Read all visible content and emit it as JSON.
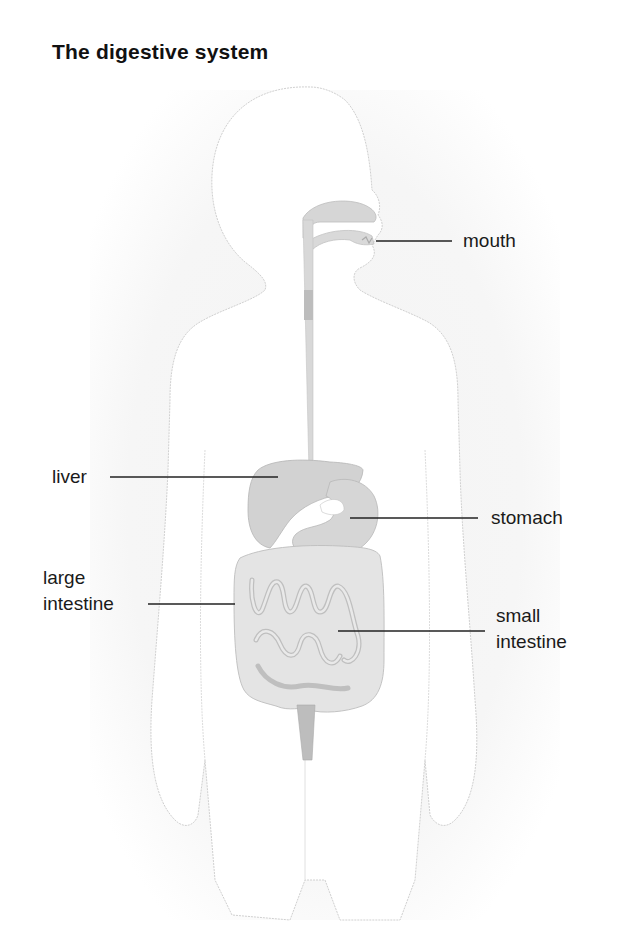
{
  "title": "The digestive system",
  "labels": {
    "mouth": "mouth",
    "liver": "liver",
    "stomach": "stomach",
    "large_intestine_1": "large",
    "large_intestine_2": "intestine",
    "small_intestine_1": "small",
    "small_intestine_2": "intestine"
  },
  "colors": {
    "background_shadow": "#f2f2f2",
    "body_fill": "#ffffff",
    "organ_fill": "#d4d4d4",
    "organ_dark": "#b5b5b5",
    "leader_line": "#222222",
    "text": "#111111"
  }
}
